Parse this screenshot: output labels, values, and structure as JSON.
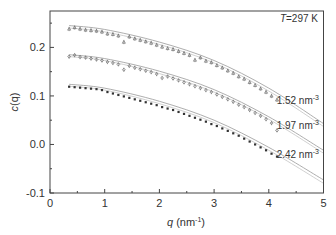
{
  "chart_data": {
    "type": "scatter",
    "title": "",
    "annotation": "T=297 K",
    "xlabel": "q (nm⁻¹)",
    "ylabel": "c(q)",
    "xlim": [
      0,
      5
    ],
    "ylim": [
      -0.1,
      0.275
    ],
    "xticks": [
      "0",
      "1",
      "2",
      "3",
      "4",
      "5"
    ],
    "yticks": [
      "-0.1",
      "0.0",
      "0.1",
      "0.2"
    ],
    "grid": false,
    "series": [
      {
        "name": "1.52 nm⁻³",
        "label": "1.52 nm",
        "marker": "open-triangle",
        "x": [
          0.35,
          0.45,
          0.55,
          0.65,
          0.75,
          0.85,
          0.95,
          1.05,
          1.15,
          1.25,
          1.35,
          1.45,
          1.55,
          1.65,
          1.75,
          1.85,
          1.95,
          2.05,
          2.15,
          2.25,
          2.35,
          2.45,
          2.55,
          2.65,
          2.75,
          2.85,
          2.95,
          3.05,
          3.15,
          3.25,
          3.35,
          3.45,
          3.55,
          3.65,
          3.75,
          3.85,
          3.95,
          4.05,
          4.15
        ],
        "y": [
          0.238,
          0.241,
          0.238,
          0.236,
          0.235,
          0.234,
          0.232,
          0.228,
          0.227,
          0.224,
          0.211,
          0.222,
          0.218,
          0.215,
          0.212,
          0.209,
          0.205,
          0.201,
          0.198,
          0.196,
          0.192,
          0.188,
          0.184,
          0.174,
          0.179,
          0.172,
          0.169,
          0.163,
          0.158,
          0.152,
          0.147,
          0.14,
          0.135,
          0.128,
          0.122,
          0.115,
          0.108,
          0.1,
          0.092
        ],
        "fit_x": [
          0.35,
          1.0,
          2.0,
          3.0,
          4.0,
          5.0
        ],
        "fit_y": [
          0.245,
          0.237,
          0.211,
          0.173,
          0.116,
          0.043
        ],
        "fit2_y": [
          0.24,
          0.232,
          0.206,
          0.168,
          0.11,
          0.037
        ]
      },
      {
        "name": "1.97 nm⁻³",
        "label": "1.97 nm",
        "marker": "open-diamond",
        "x": [
          0.35,
          0.45,
          0.55,
          0.65,
          0.75,
          0.85,
          0.95,
          1.05,
          1.15,
          1.25,
          1.35,
          1.45,
          1.55,
          1.65,
          1.75,
          1.85,
          1.95,
          2.05,
          2.15,
          2.25,
          2.35,
          2.45,
          2.55,
          2.65,
          2.75,
          2.85,
          2.95,
          3.05,
          3.15,
          3.25,
          3.35,
          3.45,
          3.55,
          3.65,
          3.75,
          3.85,
          3.95,
          4.05,
          4.15
        ],
        "y": [
          0.181,
          0.184,
          0.18,
          0.179,
          0.177,
          0.175,
          0.173,
          0.17,
          0.168,
          0.165,
          0.154,
          0.162,
          0.158,
          0.155,
          0.152,
          0.149,
          0.145,
          0.137,
          0.14,
          0.136,
          0.132,
          0.128,
          0.124,
          0.12,
          0.116,
          0.112,
          0.108,
          0.103,
          0.098,
          0.093,
          0.088,
          0.082,
          0.077,
          0.071,
          0.065,
          0.059,
          0.052,
          0.044,
          0.029
        ],
        "fit_x": [
          0.35,
          1.0,
          2.0,
          3.0,
          4.0,
          5.0
        ],
        "fit_y": [
          0.185,
          0.177,
          0.151,
          0.113,
          0.057,
          -0.012
        ],
        "fit2_y": [
          0.181,
          0.173,
          0.146,
          0.108,
          0.052,
          -0.018
        ]
      },
      {
        "name": "2.42 nm⁻³",
        "label": "2.42 nm",
        "marker": "filled-square",
        "x": [
          0.35,
          0.45,
          0.55,
          0.65,
          0.75,
          0.85,
          0.95,
          1.05,
          1.15,
          1.25,
          1.35,
          1.45,
          1.55,
          1.65,
          1.75,
          1.85,
          1.95,
          2.05,
          2.15,
          2.25,
          2.35,
          2.45,
          2.55,
          2.65,
          2.75,
          2.85,
          2.95,
          3.05,
          3.15,
          3.25,
          3.35,
          3.45,
          3.55,
          3.65,
          3.75,
          3.85,
          3.95,
          4.05,
          4.15
        ],
        "y": [
          0.119,
          0.118,
          0.117,
          0.116,
          0.115,
          0.114,
          0.112,
          0.108,
          0.105,
          0.102,
          0.099,
          0.096,
          0.093,
          0.09,
          0.087,
          0.084,
          0.081,
          0.077,
          0.074,
          0.071,
          0.067,
          0.063,
          0.059,
          0.055,
          0.051,
          0.047,
          0.042,
          0.038,
          0.033,
          0.028,
          0.023,
          0.018,
          0.012,
          0.006,
          0.0,
          -0.006,
          -0.012,
          -0.019,
          -0.025
        ],
        "fit_x": [
          0.35,
          1.0,
          2.0,
          3.0,
          4.0,
          5.0
        ],
        "fit_y": [
          0.124,
          0.116,
          0.089,
          0.05,
          -0.006,
          -0.073
        ],
        "fit2_y": [
          0.12,
          0.112,
          0.084,
          0.045,
          -0.012,
          -0.08
        ]
      }
    ]
  },
  "labels": {
    "annotation_prefix": "T",
    "annotation_rest": "=297 K",
    "ylabel_c": "c",
    "ylabel_q": "(q)",
    "xlabel_q": "q",
    "xlabel_unit": " (nm",
    "xlabel_exp": "-1",
    "xlabel_close": ")",
    "series_unit_exp": "-3"
  }
}
